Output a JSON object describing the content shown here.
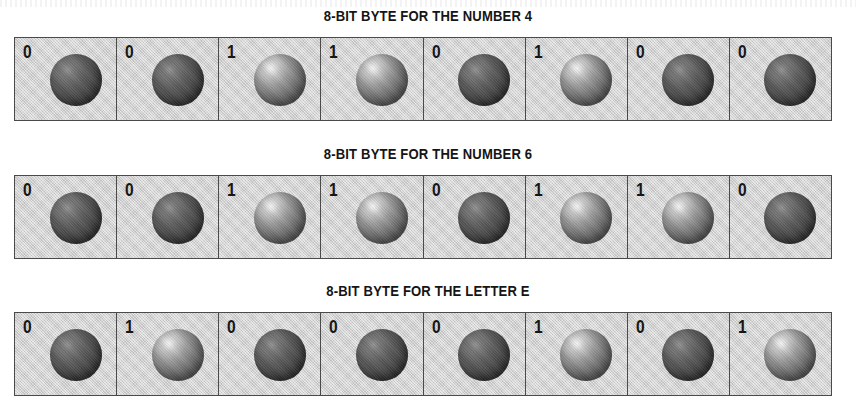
{
  "figure": {
    "caption_style": "8-bit byte diagrams",
    "bytes": [
      {
        "title": "8-BIT BYTE FOR THE NUMBER 4",
        "bits": [
          "0",
          "0",
          "1",
          "1",
          "0",
          "1",
          "0",
          "0"
        ]
      },
      {
        "title": "8-BIT BYTE FOR THE NUMBER 6",
        "bits": [
          "0",
          "0",
          "1",
          "1",
          "0",
          "1",
          "1",
          "0"
        ]
      },
      {
        "title": "8-BIT BYTE FOR THE LETTER E",
        "bits": [
          "0",
          "1",
          "0",
          "0",
          "0",
          "1",
          "0",
          "1"
        ]
      }
    ]
  },
  "colors": {
    "page_background": "#ffffff",
    "cell_background": "#cfcfcf",
    "cell_border": "#4a4a4a",
    "text": "#141414",
    "sphere_off": "#4a4a4a",
    "sphere_on": "#9d9d9d"
  }
}
